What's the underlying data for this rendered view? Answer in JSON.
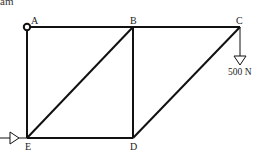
{
  "header": {
    "clipped_text": "am"
  },
  "nodes": [
    {
      "id": "A",
      "label": "A",
      "x": 27,
      "y": 27
    },
    {
      "id": "B",
      "label": "B",
      "x": 133,
      "y": 27
    },
    {
      "id": "C",
      "label": "C",
      "x": 240,
      "y": 27
    },
    {
      "id": "D",
      "label": "D",
      "x": 133,
      "y": 138
    },
    {
      "id": "E",
      "label": "E",
      "x": 27,
      "y": 138
    }
  ],
  "members": [
    [
      "A",
      "B"
    ],
    [
      "B",
      "C"
    ],
    [
      "A",
      "E"
    ],
    [
      "B",
      "D"
    ],
    [
      "E",
      "D"
    ],
    [
      "E",
      "B"
    ],
    [
      "D",
      "C"
    ]
  ],
  "supports": {
    "A": "pin",
    "E": "roller"
  },
  "load": {
    "node": "C",
    "direction": "down",
    "label": "500 N"
  },
  "colors": {
    "line": "#111111",
    "background": "#ffffff"
  }
}
